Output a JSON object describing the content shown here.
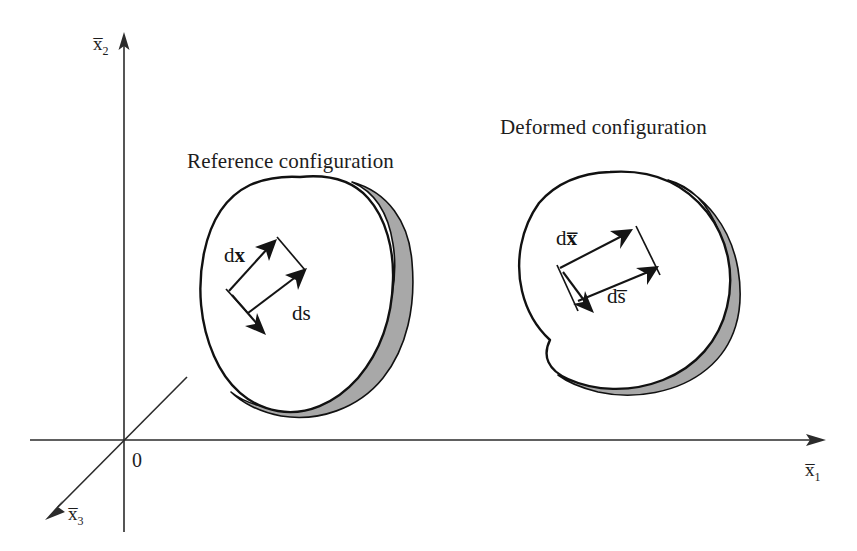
{
  "figure": {
    "background_color": "#ffffff",
    "ink_color": "#1a1a1a",
    "shade_color": "#a8a8a8"
  },
  "axes": {
    "origin_label": "0",
    "x1": {
      "symbol": "x",
      "subscript": "1",
      "overbar": true,
      "label": "x̅1",
      "direction": "right"
    },
    "x2": {
      "symbol": "x",
      "subscript": "2",
      "overbar": true,
      "label": "x̅2",
      "direction": "up"
    },
    "x3": {
      "symbol": "x",
      "subscript": "3",
      "overbar": true,
      "label": "x̅3",
      "direction": "down-left"
    }
  },
  "bodies": [
    {
      "id": "reference",
      "title": "Reference configuration",
      "shade_color": "#a8a8a8",
      "vectors": [
        {
          "id": "dx",
          "prefix": "d",
          "symbol": "x",
          "bold": true,
          "overbar": false,
          "label": "dx"
        },
        {
          "id": "ds",
          "prefix": "d",
          "symbol": "s",
          "bold": false,
          "overbar": false,
          "label": "ds"
        }
      ]
    },
    {
      "id": "deformed",
      "title": "Deformed configuration",
      "shade_color": "#a8a8a8",
      "vectors": [
        {
          "id": "dxbar",
          "prefix": "d",
          "symbol": "x",
          "bold": true,
          "overbar": true,
          "label": "dx̅"
        },
        {
          "id": "dsbar",
          "prefix": "d",
          "symbol": "s",
          "bold": false,
          "overbar": true,
          "label": "ds̅"
        }
      ]
    }
  ]
}
